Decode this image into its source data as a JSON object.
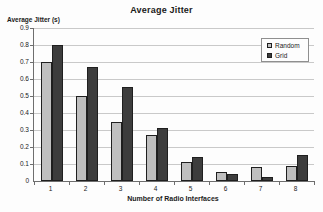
{
  "title": "Average Jitter",
  "colors": {
    "random_bar": "#bfbfbf",
    "grid_bar": "#3d3d3d",
    "gridline": "#c9c9c9",
    "axis": "#6e6e6e",
    "background": "#fdfdfd"
  },
  "legend": {
    "position": "top-right",
    "items": [
      {
        "label": "Random",
        "color": "#bfbfbf"
      },
      {
        "label": "Grid",
        "color": "#3d3d3d"
      }
    ]
  },
  "chart_data": {
    "type": "bar",
    "title": "Average Jitter",
    "xlabel": "Number of Radio Interfaces",
    "ylabel": "Average Jitter (s)",
    "categories": [
      "1",
      "2",
      "3",
      "4",
      "5",
      "6",
      "7",
      "8"
    ],
    "series": [
      {
        "name": "Random",
        "color": "#bfbfbf",
        "values": [
          0.7,
          0.5,
          0.35,
          0.27,
          0.11,
          0.055,
          0.085,
          0.09
        ]
      },
      {
        "name": "Grid",
        "color": "#3d3d3d",
        "values": [
          0.8,
          0.67,
          0.55,
          0.31,
          0.14,
          0.04,
          0.025,
          0.15
        ]
      }
    ],
    "ylim": [
      0,
      0.9
    ],
    "ytick_step": 0.1,
    "ytick_labels": [
      "0",
      "0.1",
      "0.2",
      "0.3",
      "0.4",
      "0.5",
      "0.6",
      "0.7",
      "0.8",
      "0.9"
    ],
    "grid": true,
    "legend_position": "top-right"
  }
}
